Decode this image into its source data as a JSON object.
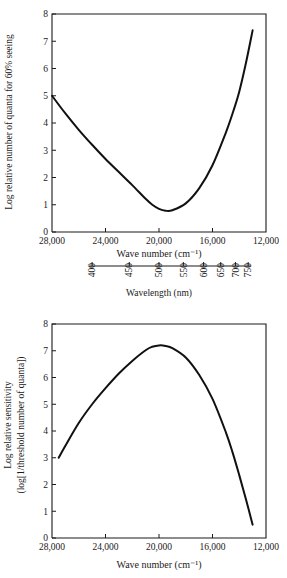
{
  "figure": {
    "title_visible": "",
    "background": "#ffffff",
    "ink": "#111111"
  },
  "chart_data": [
    {
      "id": "top",
      "type": "line",
      "title": "",
      "xlabel": "Wave number (cm⁻¹)",
      "ylabel": "Log relative number of quanta for 60% seeing",
      "xlim": [
        28000,
        12000
      ],
      "ylim": [
        0,
        8
      ],
      "xticks": [
        28000,
        24000,
        20000,
        16000,
        12000
      ],
      "xticklabels": [
        "28,000",
        "24,000",
        "20,000",
        "16,000",
        "12,000"
      ],
      "yticks": [
        0,
        1,
        2,
        3,
        4,
        5,
        6,
        7,
        8
      ],
      "yticklabels": [
        "0",
        "1",
        "2",
        "3",
        "4",
        "5",
        "6",
        "7",
        "8"
      ],
      "grid": false,
      "legend": "none",
      "secondary_axis": {
        "label": "Wavelength (nm)",
        "ticks_nm": [
          400,
          450,
          500,
          550,
          600,
          650,
          700,
          750
        ],
        "ticklabels": [
          "400",
          "450",
          "500",
          "550",
          "600",
          "650",
          "700",
          "750"
        ],
        "orientation": "vertical-labels"
      },
      "series": [
        {
          "name": "Log relative number of quanta for 60% seeing",
          "x": [
            28000,
            27000,
            26000,
            25000,
            24000,
            23000,
            22000,
            21000,
            20500,
            20000,
            19500,
            19000,
            18000,
            17000,
            16000,
            15000,
            14500,
            14000,
            13500,
            13000
          ],
          "y": [
            5.0,
            4.35,
            3.75,
            3.2,
            2.68,
            2.2,
            1.72,
            1.22,
            1.0,
            0.85,
            0.78,
            0.8,
            1.05,
            1.6,
            2.45,
            3.65,
            4.35,
            5.15,
            6.2,
            7.4
          ]
        }
      ]
    },
    {
      "id": "bottom",
      "type": "line",
      "title": "",
      "xlabel": "Wave number (cm⁻¹)",
      "ylabel_line1": "Log relative sensitivity",
      "ylabel_line2": "(log[1/threshold number of quanta])",
      "xlim": [
        28000,
        12000
      ],
      "ylim": [
        0,
        8
      ],
      "xticks": [
        28000,
        24000,
        20000,
        16000,
        12000
      ],
      "xticklabels": [
        "28,000",
        "24,000",
        "20,000",
        "16,000",
        "12,000"
      ],
      "yticks": [
        0,
        1,
        2,
        3,
        4,
        5,
        6,
        7,
        8
      ],
      "yticklabels": [
        "0",
        "1",
        "2",
        "3",
        "4",
        "5",
        "6",
        "7",
        "8"
      ],
      "grid": false,
      "legend": "none",
      "series": [
        {
          "name": "Log relative sensitivity (log[1/threshold number of quanta])",
          "x": [
            27500,
            27000,
            26000,
            25000,
            24000,
            23000,
            22000,
            21000,
            20500,
            20000,
            19500,
            19000,
            18000,
            17000,
            16000,
            15000,
            14500,
            14000,
            13500,
            13000
          ],
          "y": [
            3.0,
            3.45,
            4.3,
            5.0,
            5.6,
            6.15,
            6.62,
            7.02,
            7.15,
            7.2,
            7.18,
            7.1,
            6.75,
            6.1,
            5.2,
            3.95,
            3.2,
            2.35,
            1.45,
            0.5
          ]
        }
      ]
    }
  ]
}
